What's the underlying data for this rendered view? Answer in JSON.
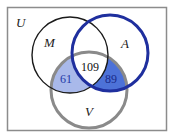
{
  "diagram": {
    "type": "venn",
    "universe_label": "U",
    "sets": [
      {
        "id": "M",
        "label": "M",
        "cx": 70,
        "cy": 55,
        "r": 38,
        "stroke": "#1a1a1a",
        "stroke_width": 1.4
      },
      {
        "id": "A",
        "label": "A",
        "cx": 110,
        "cy": 53,
        "r": 38,
        "stroke": "#1f2f9e",
        "stroke_width": 3
      },
      {
        "id": "V",
        "label": "V",
        "cx": 89,
        "cy": 90,
        "r": 38,
        "stroke": "#8a8a8a",
        "stroke_width": 3
      }
    ],
    "regions": [
      {
        "name": "M∩A∩V",
        "value": "109",
        "fill": "#ffffff",
        "text_color": "#111111"
      },
      {
        "name": "M∩V only",
        "value": "61",
        "fill": "#a9b9ea",
        "text_color": "#1f3aa8"
      },
      {
        "name": "A∩V only",
        "value": "89",
        "fill": "#4d72d8",
        "text_color": "#1a2a8a"
      }
    ],
    "frame": {
      "x": 7,
      "y": 7,
      "width": 160,
      "height": 124,
      "stroke": "#888888"
    }
  }
}
